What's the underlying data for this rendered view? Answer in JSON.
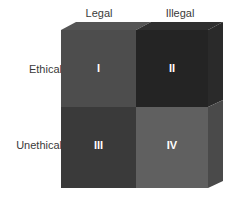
{
  "figure": {
    "background_color": "#ffffff"
  },
  "columns": [
    {
      "id": "legal",
      "label": "Legal"
    },
    {
      "id": "illegal",
      "label": "Illegal"
    }
  ],
  "rows": [
    {
      "id": "ethical",
      "label": "Ethical"
    },
    {
      "id": "unethical",
      "label": "Unethical"
    }
  ],
  "quadrants": [
    {
      "id": "quadrant-1",
      "numeral": "I",
      "row": "Ethical",
      "column": "Legal",
      "face_color": "#4d4d4d",
      "label_color": "#ffffff"
    },
    {
      "id": "quadrant-2",
      "numeral": "II",
      "row": "Ethical",
      "column": "Illegal",
      "face_color": "#242424",
      "label_color": "#ffffff"
    },
    {
      "id": "quadrant-3",
      "numeral": "III",
      "row": "Unethical",
      "column": "Legal",
      "face_color": "#3a3a3a",
      "label_color": "#ffffff"
    },
    {
      "id": "quadrant-4",
      "numeral": "IV",
      "row": "Unethical",
      "column": "Illegal",
      "face_color": "#606060",
      "label_color": "#ffffff"
    }
  ],
  "bevel": {
    "top_left_color": "#555555",
    "top_right_color": "#2f2f2f",
    "side_top_color": "#2a2a2a",
    "side_bottom_color": "#4a4a4a"
  },
  "text_color": "#3a3a3a"
}
